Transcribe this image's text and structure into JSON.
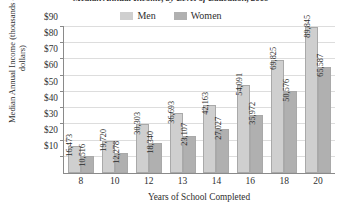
{
  "chart_data": {
    "type": "bar",
    "title": "Median Annual Income, by Level of Education, 2009",
    "xlabel": "Years of School Completed",
    "ylabel": "Median Annual Income (thousands of dollars)",
    "categories": [
      "8",
      "10",
      "12",
      "13",
      "14",
      "16",
      "18",
      "20"
    ],
    "series": [
      {
        "name": "Men",
        "color": "#cfcfcf",
        "values": [
          16473,
          19720,
          30303,
          36693,
          42163,
          54091,
          69825,
          89845
        ],
        "labels": [
          "16,473",
          "19,720",
          "30,303",
          "36,693",
          "42,163",
          "54,091",
          "69,825",
          "89,845"
        ]
      },
      {
        "name": "Women",
        "color": "#b0b0b0",
        "values": [
          10516,
          12278,
          18340,
          23107,
          27027,
          35972,
          50576,
          65587
        ],
        "labels": [
          "10,516",
          "12,278",
          "18,340",
          "23,107",
          "27,027",
          "35,972",
          "50,576",
          "65,587"
        ]
      }
    ],
    "ylim": [
      0,
      90000
    ],
    "ytick_values": [
      10000,
      20000,
      30000,
      40000,
      50000,
      60000,
      70000,
      80000,
      90000
    ],
    "ytick_labels": [
      "$10",
      "$20",
      "$30",
      "$40",
      "$50",
      "$60",
      "$70",
      "$80",
      "$90"
    ],
    "grid": true,
    "legend_position": "top-center"
  }
}
